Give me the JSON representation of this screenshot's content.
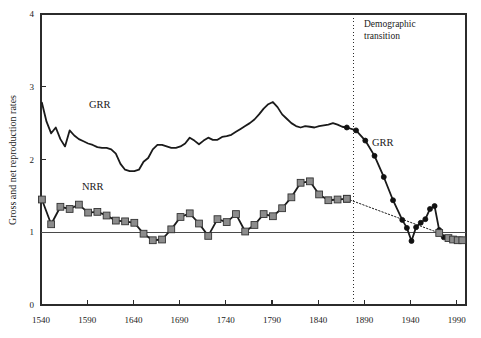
{
  "chart_data": {
    "type": "line",
    "title": "",
    "xlabel": "",
    "ylabel": "Gross and net reproduction rates",
    "xlim": [
      1540,
      2000
    ],
    "ylim": [
      0,
      4
    ],
    "xticks": [
      1540,
      1590,
      1640,
      1690,
      1740,
      1790,
      1840,
      1890,
      1940,
      1990
    ],
    "yticks": [
      0,
      1,
      2,
      3,
      4
    ],
    "grid": false,
    "legend_position": "inline-annotations",
    "reference_line_y": 1,
    "annotations": [
      {
        "name": "demographic-transition",
        "text": "Demographic transition",
        "x": 1878,
        "style": "vertical-dotted-line"
      },
      {
        "name": "grr-label-early",
        "text": "GRR",
        "x": 1590,
        "y": 2.72
      },
      {
        "name": "nrr-label-early",
        "text": "NRR",
        "x": 1583,
        "y": 1.62
      },
      {
        "name": "grr-label-late",
        "text": "GRR",
        "x": 1903,
        "y": 2.22
      }
    ],
    "series": [
      {
        "name": "GRR",
        "label": "Gross reproduction rate",
        "color": "#1a1a1a",
        "marker": "none",
        "linestyle": "solid",
        "segment": "pre-transition",
        "x": [
          1541,
          1546,
          1551,
          1556,
          1561,
          1566,
          1571,
          1576,
          1581,
          1586,
          1591,
          1596,
          1601,
          1606,
          1611,
          1616,
          1621,
          1626,
          1631,
          1636,
          1641,
          1646,
          1651,
          1656,
          1661,
          1666,
          1671,
          1676,
          1681,
          1686,
          1691,
          1696,
          1701,
          1706,
          1711,
          1716,
          1721,
          1726,
          1731,
          1736,
          1741,
          1746,
          1751,
          1756,
          1761,
          1766,
          1771,
          1776,
          1781,
          1786,
          1791,
          1796,
          1801,
          1806,
          1811,
          1816,
          1821,
          1826,
          1831,
          1836,
          1841,
          1846,
          1851,
          1856,
          1861,
          1866,
          1871
        ],
        "y": [
          2.78,
          2.52,
          2.36,
          2.44,
          2.28,
          2.18,
          2.4,
          2.33,
          2.28,
          2.25,
          2.22,
          2.2,
          2.17,
          2.16,
          2.16,
          2.14,
          2.08,
          1.94,
          1.86,
          1.84,
          1.84,
          1.86,
          1.97,
          2.02,
          2.14,
          2.2,
          2.2,
          2.18,
          2.16,
          2.16,
          2.18,
          2.22,
          2.3,
          2.26,
          2.21,
          2.26,
          2.3,
          2.27,
          2.27,
          2.31,
          2.32,
          2.34,
          2.38,
          2.42,
          2.46,
          2.5,
          2.55,
          2.62,
          2.7,
          2.76,
          2.79,
          2.72,
          2.62,
          2.56,
          2.5,
          2.46,
          2.44,
          2.46,
          2.45,
          2.44,
          2.46,
          2.47,
          2.48,
          2.5,
          2.48,
          2.45,
          2.44
        ]
      },
      {
        "name": "GRR-modern",
        "label": "Gross reproduction rate (post transition)",
        "color": "#1a1a1a",
        "marker": "circle",
        "linestyle": "solid",
        "segment": "post-transition",
        "x": [
          1871,
          1881,
          1891,
          1901,
          1911,
          1921,
          1931,
          1936,
          1941,
          1946,
          1951,
          1956,
          1961,
          1966,
          1971,
          1976,
          1981,
          1986,
          1991,
          1996
        ],
        "y": [
          2.44,
          2.4,
          2.26,
          2.05,
          1.76,
          1.44,
          1.17,
          1.06,
          0.88,
          1.07,
          1.13,
          1.18,
          1.32,
          1.36,
          1.03,
          0.93,
          0.92,
          0.91,
          0.9,
          0.9
        ]
      },
      {
        "name": "NRR",
        "label": "Net reproduction rate",
        "color": "#1a1a1a",
        "markerFill": "#8c8c8c",
        "marker": "square",
        "linestyle": "solid",
        "segment": "pre-transition",
        "x": [
          1541,
          1551,
          1561,
          1571,
          1581,
          1591,
          1601,
          1611,
          1621,
          1631,
          1641,
          1651,
          1661,
          1671,
          1681,
          1691,
          1701,
          1711,
          1721,
          1731,
          1741,
          1751,
          1761,
          1771,
          1781,
          1791,
          1801,
          1811,
          1821,
          1831,
          1841,
          1851,
          1861,
          1871
        ],
        "y": [
          1.45,
          1.11,
          1.35,
          1.32,
          1.38,
          1.27,
          1.28,
          1.23,
          1.16,
          1.15,
          1.13,
          0.98,
          0.89,
          0.9,
          1.04,
          1.21,
          1.26,
          1.12,
          0.95,
          1.18,
          1.14,
          1.25,
          1.01,
          1.1,
          1.25,
          1.22,
          1.33,
          1.48,
          1.68,
          1.7,
          1.52,
          1.44,
          1.45,
          1.46
        ]
      },
      {
        "name": "NRR-modern",
        "label": "Net reproduction rate (post transition)",
        "color": "#1a1a1a",
        "markerFill": "#8c8c8c",
        "marker": "square",
        "linestyle": "dotted",
        "segment": "post-transition",
        "x": [
          1871,
          1971,
          1981,
          1986,
          1991,
          1996
        ],
        "y": [
          1.46,
          0.99,
          0.92,
          0.9,
          0.89,
          0.89
        ]
      }
    ]
  },
  "axis": {
    "y_title": "Gross and net reproduction rates",
    "ytick_labels": [
      "0",
      "1",
      "2",
      "3",
      "4"
    ],
    "xtick_labels": [
      "1540",
      "1590",
      "1640",
      "1690",
      "1740",
      "1790",
      "1840",
      "1890",
      "1940",
      "1990"
    ]
  },
  "labels": {
    "grr_early": "GRR",
    "grr_late": "GRR",
    "nrr_early": "NRR",
    "demographic_transition_line1": "Demographic",
    "demographic_transition_line2": "transition"
  },
  "colors": {
    "line": "#1a1a1a",
    "marker_fill": "#8c8c8c",
    "frame": "#2b2b2b",
    "background": "#ffffff"
  }
}
